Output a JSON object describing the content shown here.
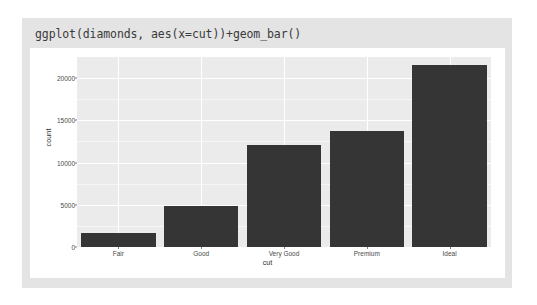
{
  "title": "ggplot(diamonds, aes(x=cut))+geom_bar()",
  "colors": {
    "card_background": "#e4e4e4",
    "plot_background": "#ffffff",
    "panel_background": "#ebebeb",
    "gridline": "#ffffff",
    "bar_fill": "#353535",
    "text": "#4a4a4a"
  },
  "chart_data": {
    "type": "bar",
    "title": "",
    "xlabel": "cut",
    "ylabel": "count",
    "categories": [
      "Fair",
      "Good",
      "Very Good",
      "Premium",
      "Ideal"
    ],
    "values": [
      1610,
      4906,
      12082,
      13791,
      21551
    ],
    "ylim": [
      0,
      22500
    ],
    "yticks": [
      0,
      5000,
      10000,
      15000,
      20000
    ],
    "ytick_labels": [
      "0",
      "5000",
      "10000",
      "15000",
      "20000"
    ],
    "grid": true,
    "legend": "none"
  }
}
